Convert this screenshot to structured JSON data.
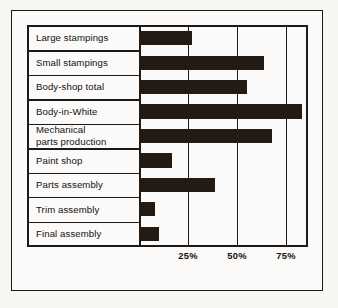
{
  "figure": {
    "background": "#f7f6f3",
    "ink": "#241a14"
  },
  "chart_data": {
    "type": "bar",
    "orientation": "horizontal",
    "title": "",
    "xlabel": "",
    "ylabel": "",
    "xlim": [
      0,
      90
    ],
    "grid": true,
    "legend": false,
    "xtick_labels": [
      "25%",
      "50%",
      "75%"
    ],
    "xtick_values": [
      25,
      50,
      75
    ],
    "categories": [
      "Large stampings",
      "Small stampings",
      "Body-shop total",
      "Body-in-White",
      "Mechanical\nparts production",
      "Paint shop",
      "Parts assembly",
      "Trim assembly",
      "Final assembly"
    ],
    "values": [
      27,
      64,
      55,
      83,
      68,
      17,
      39,
      8,
      10
    ],
    "series": [
      {
        "name": "Automation level",
        "values": [
          27,
          64,
          55,
          83,
          68,
          17,
          39,
          8,
          10
        ]
      }
    ]
  },
  "rows": [
    {
      "label": "Large stampings",
      "value": 27
    },
    {
      "label": "Small stampings",
      "value": 64
    },
    {
      "label": "Body-shop total",
      "value": 55
    },
    {
      "label": "Body-in-White",
      "value": 83
    },
    {
      "label": "Mechanical\nparts production",
      "value": 68
    },
    {
      "label": "Paint shop",
      "value": 17
    },
    {
      "label": "Parts assembly",
      "value": 39
    },
    {
      "label": "Trim assembly",
      "value": 8
    },
    {
      "label": "Final assembly",
      "value": 10
    }
  ],
  "ticks": [
    {
      "label": "25%",
      "value": 25
    },
    {
      "label": "50%",
      "value": 50
    },
    {
      "label": "75%",
      "value": 75
    }
  ]
}
